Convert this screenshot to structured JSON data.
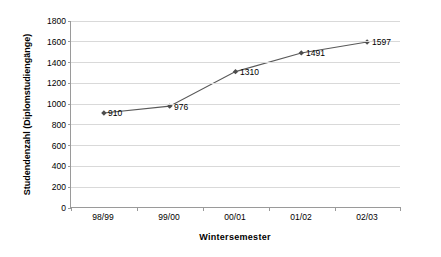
{
  "chart_data": {
    "type": "line",
    "title": "",
    "subtitle": "",
    "xlabel": "Wintersemester",
    "ylabel": "Studendenzahl (Diplomstudiengänge)",
    "categories": [
      "98/99",
      "99/00",
      "00/01",
      "01/02",
      "02/03"
    ],
    "values": [
      910,
      976,
      1310,
      1491,
      1597
    ],
    "data_labels": [
      "910",
      "976",
      "1310",
      "1491",
      "1597"
    ],
    "series": [
      {
        "name": "Studendenzahl (Diplomstudiengänge)",
        "values": [
          910,
          976,
          1310,
          1491,
          1597
        ]
      }
    ],
    "ylim": [
      0,
      1800
    ],
    "ytick_step": 200,
    "ytick_labels": [
      "0",
      "200",
      "400",
      "600",
      "800",
      "1000",
      "1200",
      "1400",
      "1600",
      "1800"
    ],
    "ytick_values": [
      0,
      200,
      400,
      600,
      800,
      1000,
      1200,
      1400,
      1600,
      1800
    ],
    "grid": "horizontal",
    "legend": "none",
    "marker": "diamond",
    "line_color": "#595959",
    "marker_color": "#4d4d4d",
    "gridline_color": "#d9d9d9",
    "axis_color": "#9a9a9a",
    "text_color": "#000000",
    "background_color": "#ffffff"
  }
}
